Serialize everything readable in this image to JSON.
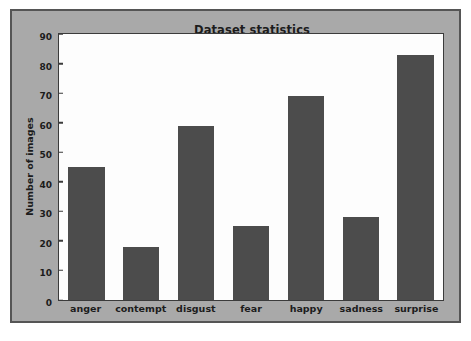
{
  "chart_data": {
    "type": "bar",
    "title": "Dataset statistics",
    "xlabel": "",
    "ylabel": "Number of images",
    "categories": [
      "anger",
      "contempt",
      "disgust",
      "fear",
      "happy",
      "sadness",
      "surprise"
    ],
    "values": [
      45,
      18,
      59,
      25,
      69,
      28,
      83
    ],
    "ylim": [
      0,
      90
    ],
    "yticks": [
      0,
      10,
      20,
      30,
      40,
      50,
      60,
      70,
      80,
      90
    ],
    "ytick_labels": [
      "0",
      "10",
      "20",
      "30",
      "40",
      "50",
      "60",
      "70",
      "80",
      "90"
    ],
    "grid": false,
    "legend": null,
    "bar_color": "#4c4c4c",
    "figure_background": "#a9a9a9",
    "axes_background": "#fdfdfd",
    "axis_color": "#3b3b3b",
    "text_color": "#1c1c1c"
  }
}
